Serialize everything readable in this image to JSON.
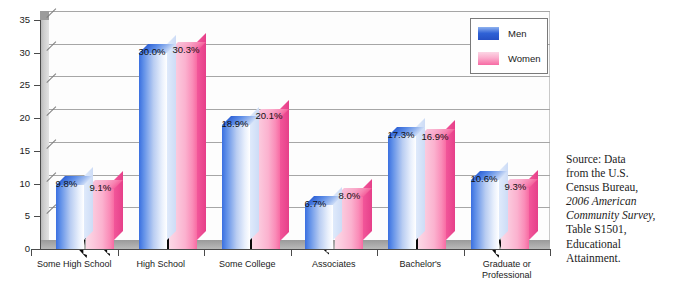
{
  "chart_data": {
    "type": "bar",
    "title": "",
    "subtitle": "",
    "xlabel": "",
    "ylabel": "",
    "ylim": [
      0,
      35
    ],
    "ytick_values": [
      0,
      5,
      10,
      15,
      20,
      25,
      30,
      35
    ],
    "ytick_labels": [
      "0",
      "5",
      "10",
      "15",
      "20",
      "25",
      "30",
      "35"
    ],
    "grid": true,
    "grid_axis": "y",
    "legend_position": "top-right",
    "style": "3d-bar-with-silhouettes",
    "categories": [
      "Some High School",
      "High School",
      "Some College",
      "Associates",
      "Bachelor's",
      "Graduate or\nProfessional"
    ],
    "series": [
      {
        "name": "Men",
        "color": "#2f62d6",
        "values": [
          9.8,
          30.0,
          18.9,
          6.7,
          17.3,
          10.6
        ],
        "labels": [
          "9.8%",
          "30.0%",
          "18.9%",
          "6.7%",
          "17.3%",
          "10.6%"
        ]
      },
      {
        "name": "Women",
        "color": "#f76ba4",
        "values": [
          9.1,
          30.3,
          20.1,
          8.0,
          16.9,
          9.3
        ],
        "labels": [
          "9.1%",
          "30.3%",
          "20.1%",
          "8.0%",
          "16.9%",
          "9.3%"
        ]
      }
    ]
  },
  "legend": {
    "items": [
      {
        "label": "Men",
        "swatch": "men-swatch",
        "color": "#2f62d6"
      },
      {
        "label": "Women",
        "swatch": "women-swatch",
        "color": "#f76ba4"
      }
    ]
  },
  "axis": {
    "y_labels": [
      "35",
      "30",
      "25",
      "20",
      "15",
      "10",
      "5",
      "0"
    ],
    "x_labels": [
      "Some High School",
      "High School",
      "Some College",
      "Associates",
      "Bachelor's",
      "Graduate or\nProfessional"
    ]
  },
  "source_note": {
    "lines": [
      {
        "text": "Source: Data",
        "italic": false
      },
      {
        "text": "from the U.S.",
        "italic": false
      },
      {
        "text": "Census Bureau,",
        "italic": false
      },
      {
        "text": "2006 American",
        "italic": true
      },
      {
        "text": "Community Survey,",
        "italic": true
      },
      {
        "text": "Table S1501,",
        "italic": false
      },
      {
        "text": "Educational",
        "italic": false
      },
      {
        "text": "Attainment.",
        "italic": false
      }
    ],
    "full_text": "Source: Data from the U.S. Census Bureau, 2006 American Community Survey, Table S1501, Educational Attainment."
  },
  "colors": {
    "men_bar": "#2f62d6",
    "women_bar": "#f76ba4",
    "wall": "#c9c9c9",
    "floor": "#a8a8a8",
    "gridline": "#a6a6a6",
    "axis": "#4a4a4a",
    "background": "#ffffff",
    "silhouette": "#0a0a0a"
  }
}
